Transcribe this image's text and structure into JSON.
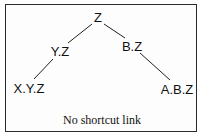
{
  "diagram": {
    "type": "tree",
    "nodes": [
      {
        "id": "z",
        "label": "Z",
        "x": 98,
        "y": 17
      },
      {
        "id": "yz",
        "label": "Y.Z",
        "x": 60,
        "y": 51
      },
      {
        "id": "bz",
        "label": "B.Z",
        "x": 132,
        "y": 46
      },
      {
        "id": "xyz",
        "label": "X.Y.Z",
        "x": 29,
        "y": 88
      },
      {
        "id": "abz",
        "label": "A.B.Z",
        "x": 177,
        "y": 89
      }
    ],
    "edges": [
      {
        "from": "z",
        "to": "yz"
      },
      {
        "from": "z",
        "to": "bz"
      },
      {
        "from": "yz",
        "to": "xyz"
      },
      {
        "from": "bz",
        "to": "abz"
      }
    ],
    "caption": "No shortcut link"
  }
}
